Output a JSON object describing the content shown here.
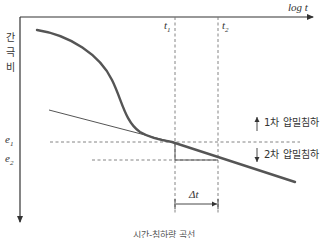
{
  "diagram": {
    "type": "time-settlement curve (consolidation)",
    "x_axis": {
      "label": "log t"
    },
    "y_axis": {
      "label_chars": [
        "간",
        "극",
        "비"
      ]
    },
    "time_markers": {
      "t1": "t",
      "t1_sub": "1",
      "t2": "t",
      "t2_sub": "2"
    },
    "void_ratio_markers": {
      "e1": "e",
      "e1_sub": "1",
      "e2": "e",
      "e2_sub": "2"
    },
    "annotations": {
      "primary": "1차 압밀침하",
      "secondary": "2차 압밀침하",
      "delta_t": "Δt"
    },
    "caption": "시간-침하량 곡선",
    "colors": {
      "curve": "#555555",
      "axis": "#333333",
      "dashed": "#777777",
      "background": "#ffffff"
    }
  }
}
